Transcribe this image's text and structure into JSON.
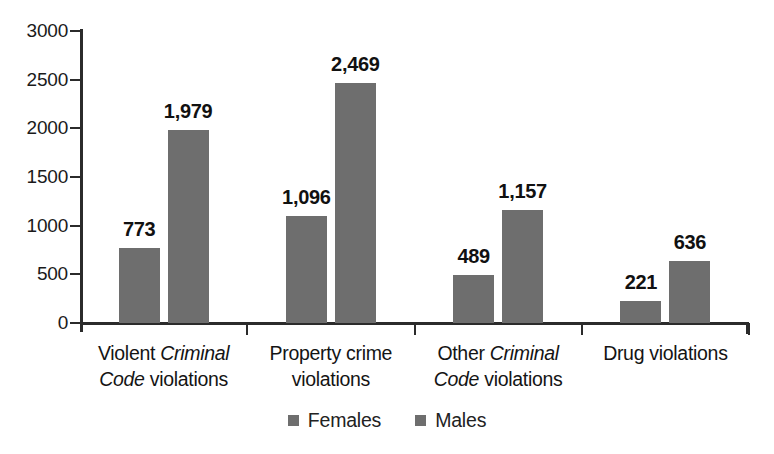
{
  "chart_data": {
    "type": "bar",
    "title": "",
    "subtitle": "",
    "xlabel": "",
    "ylabel": "",
    "ylim": [
      0,
      3000
    ],
    "grid": false,
    "legend_position": "bottom-center",
    "y_ticks": [
      "0",
      "500",
      "1000",
      "1500",
      "2000",
      "2500",
      "3000"
    ],
    "y_tick_values": [
      0,
      500,
      1000,
      1500,
      2000,
      2500,
      3000
    ],
    "categories": [
      "Violent Criminal Code violations",
      "Property crime violations",
      "Other Criminal Code violations",
      "Drug violations"
    ],
    "category_labels": [
      {
        "line1_pre": "Violent ",
        "line1_em": "Criminal",
        "line2_em": "Code",
        "line2_post": " violations"
      },
      {
        "line1_pre": "Property crime",
        "line1_em": "",
        "line2_em": "",
        "line2_post": "violations"
      },
      {
        "line1_pre": "Other ",
        "line1_em": "Criminal",
        "line2_em": "Code",
        "line2_post": " violations"
      },
      {
        "line1_pre": "Drug violations",
        "line1_em": "",
        "line2_em": "",
        "line2_post": ""
      }
    ],
    "series": [
      {
        "name": "Females",
        "color": "#6e6e6e",
        "values": [
          773,
          1096,
          489,
          221
        ],
        "labels": [
          "773",
          "1,096",
          "489",
          "221"
        ]
      },
      {
        "name": "Males",
        "color": "#6e6e6e",
        "values": [
          1979,
          2469,
          1157,
          636
        ],
        "labels": [
          "1,979",
          "2,469",
          "1,157",
          "636"
        ]
      }
    ],
    "legend": [
      {
        "label": "Females",
        "color": "#6e6e6e",
        "swatch": "square-swatch-icon"
      },
      {
        "label": "Males",
        "color": "#6e6e6e",
        "swatch": "square-swatch-icon"
      }
    ]
  },
  "axis": {
    "tick_0": "0",
    "tick_500": "500",
    "tick_1000": "1000",
    "tick_1500": "1500",
    "tick_2000": "2000",
    "tick_2500": "2500",
    "tick_3000": "3000"
  },
  "colors": {
    "bar": "#6e6e6e",
    "axis": "#2b2b2b",
    "text": "#141414",
    "background": "#ffffff"
  }
}
